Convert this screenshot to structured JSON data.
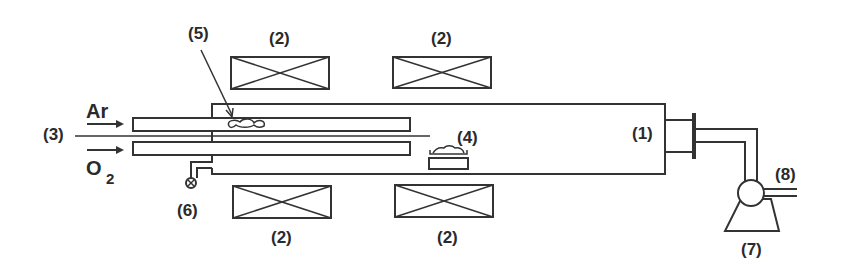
{
  "diagram": {
    "type": "furnace-apparatus-schematic",
    "colors": {
      "line": "#333333",
      "text": "#2a2a2a",
      "background": "#ffffff"
    },
    "labels": {
      "tube": "(1)",
      "heater_top_left": "(2)",
      "heater_top_right": "(2)",
      "heater_bottom_left": "(2)",
      "heater_bottom_right": "(2)",
      "inlet": "(3)",
      "substrate": "(4)",
      "source": "(5)",
      "valve": "(6)",
      "pump": "(7)",
      "exhaust": "(8)"
    },
    "gases": {
      "argon": "Ar",
      "oxygen_base": "O",
      "oxygen_sub": "2"
    }
  }
}
